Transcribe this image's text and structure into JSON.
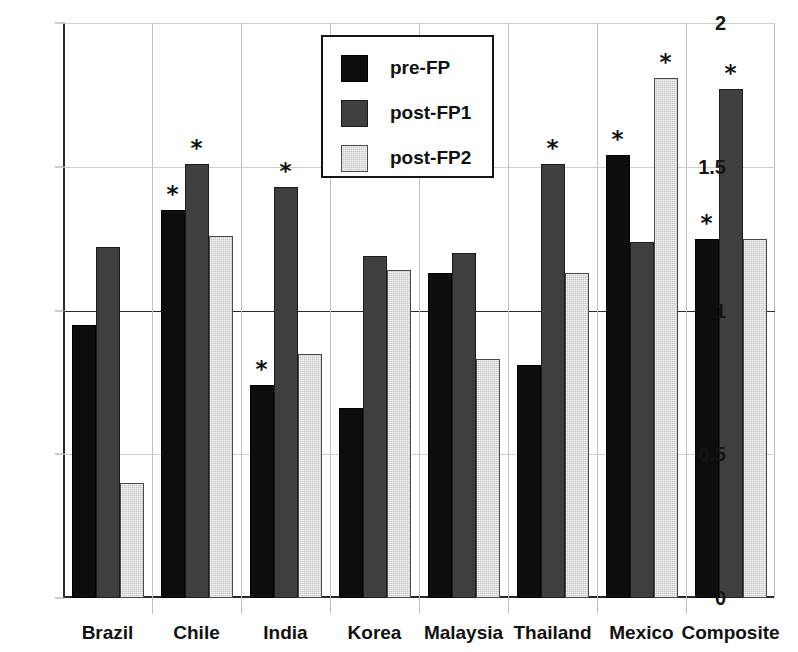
{
  "chart_data": {
    "type": "bar",
    "title": "",
    "xlabel": "",
    "ylabel": "",
    "ylim": [
      0,
      2
    ],
    "yticks": [
      "0",
      "0.5",
      "1",
      "1.5",
      "2"
    ],
    "ytick_values": [
      0,
      0.5,
      1,
      1.5,
      2
    ],
    "grid": true,
    "legend_position": "top-center",
    "categories": [
      "Brazil",
      "Chile",
      "India",
      "Korea",
      "Malaysia",
      "Thailand",
      "Mexico",
      "Composite"
    ],
    "series": [
      {
        "name": "pre-FP",
        "color": "#0d0d0d",
        "values": [
          0.95,
          1.35,
          0.74,
          0.66,
          1.13,
          0.81,
          1.54,
          1.25
        ],
        "significant": [
          false,
          true,
          true,
          false,
          false,
          false,
          true,
          true
        ]
      },
      {
        "name": "post-FP1",
        "color": "#3f3f3f",
        "values": [
          1.22,
          1.51,
          1.43,
          1.19,
          1.2,
          1.51,
          1.24,
          1.77
        ],
        "significant": [
          false,
          true,
          true,
          false,
          false,
          true,
          false,
          true
        ]
      },
      {
        "name": "post-FP2",
        "color": "#c6c6c6",
        "values": [
          0.4,
          1.26,
          0.85,
          1.14,
          0.83,
          1.13,
          1.81,
          1.25
        ],
        "significant": [
          false,
          false,
          false,
          false,
          false,
          false,
          true,
          false
        ]
      }
    ],
    "significance_marker": "*",
    "significance_note": "* marks statistically significant values"
  },
  "legend": {
    "items": [
      {
        "label": "pre-FP"
      },
      {
        "label": "post-FP1"
      },
      {
        "label": "post-FP2"
      }
    ]
  },
  "artifact": {
    "line1": "·",
    "line2": "·",
    "line3": "·"
  }
}
